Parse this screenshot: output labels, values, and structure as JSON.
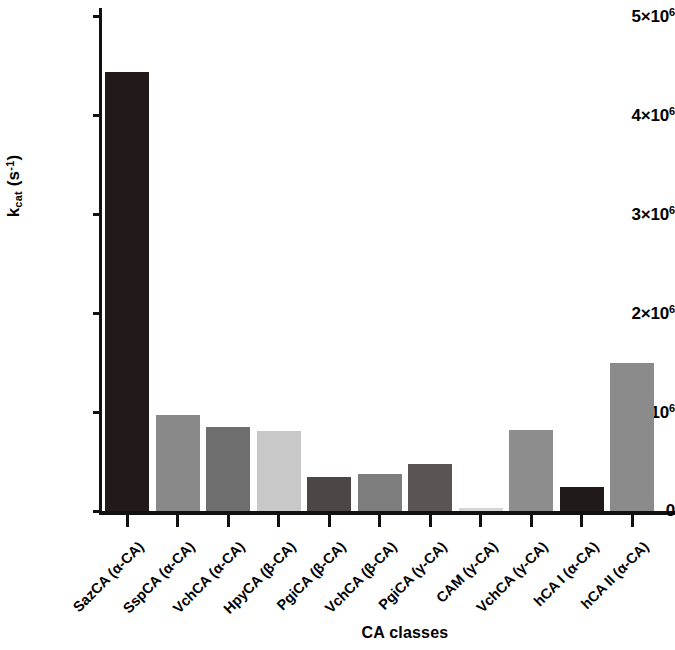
{
  "chart_data": {
    "type": "bar",
    "title": "",
    "xlabel": "CA classes",
    "ylabel": "k_cat (s^-1)",
    "ylabel_base": "k",
    "ylabel_sub": "cat",
    "ylabel_unit": "(s",
    "ylabel_unit_sup": "-1",
    "ylabel_unit_close": ")",
    "ylim": [
      0,
      5000000
    ],
    "grid": false,
    "legend": null,
    "y_ticks": [
      {
        "value": 0,
        "label": "0",
        "mantissa": "0",
        "exponent": ""
      },
      {
        "value": 1000000,
        "label": "1×10⁶",
        "mantissa": "1×10",
        "exponent": "6"
      },
      {
        "value": 2000000,
        "label": "2×10⁶",
        "mantissa": "2×10",
        "exponent": "6"
      },
      {
        "value": 3000000,
        "label": "3×10⁶",
        "mantissa": "3×10",
        "exponent": "6"
      },
      {
        "value": 4000000,
        "label": "4×10⁶",
        "mantissa": "4×10",
        "exponent": "6"
      },
      {
        "value": 5000000,
        "label": "5×10⁶",
        "mantissa": "5×10",
        "exponent": "6"
      }
    ],
    "categories": [
      "SazCA (α-CA)",
      "SspCA (α-CA)",
      "VchCA (α-CA)",
      "HpyCA (β-CA)",
      "PgiCA (β-CA)",
      "VchCA (β-CA)",
      "PgiCA (γ-CA)",
      "CAM (γ-CA)",
      "VchCA (γ-CA)",
      "hCA I (α-CA)",
      "hCA II (α-CA)"
    ],
    "values": [
      4430000,
      970000,
      850000,
      810000,
      340000,
      370000,
      470000,
      30000,
      820000,
      240000,
      1500000
    ],
    "bar_colors": [
      "#211a19",
      "#898989",
      "#6e6e6e",
      "#c8c8c8",
      "#4c4646",
      "#7d7d7d",
      "#5a5453",
      "#d6d6d6",
      "#8d8d8d",
      "#201a1a",
      "#8b8b8b"
    ]
  }
}
